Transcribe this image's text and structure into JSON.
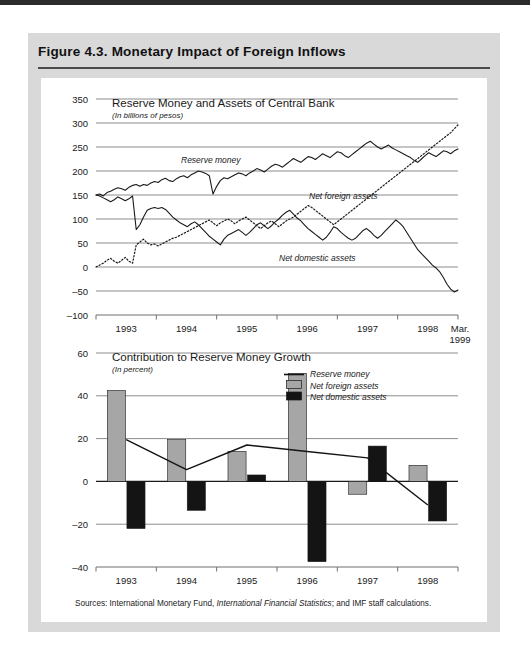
{
  "figure": {
    "title": "Figure 4.3.  Monetary Impact of Foreign Inflows",
    "sources_prefix": "Sources:  International Monetary Fund, ",
    "sources_italic": "International Financial Statistics",
    "sources_suffix": "; and IMF staff calculations."
  },
  "colors": {
    "page_background": "#ffffff",
    "panel_background": "#d9d9d9",
    "plot_background": "#ffffff",
    "top_band": "#2b2b2b",
    "rule": "#4a4a4a",
    "grid": "#8d8d8d",
    "axis": "#6f6f6f",
    "ink": "#1a1a1a",
    "series_gray": "#a6a6a6",
    "series_black": "#141414"
  },
  "chart_data": [
    {
      "type": "line",
      "id": "reserve-money-and-assets",
      "title": "Reserve Money and Assets of Central Bank",
      "subtitle": "(In billions of pesos)",
      "xlabel": "",
      "ylabel": "",
      "ylim": [
        -100,
        350
      ],
      "yticks": [
        -100,
        -50,
        0,
        50,
        100,
        150,
        200,
        250,
        300,
        350
      ],
      "xticklabels": [
        "1993",
        "1994",
        "1995",
        "1996",
        "1997",
        "1998",
        "Mar.",
        "1999"
      ],
      "xlim_years": [
        1992.75,
        1999.25
      ],
      "grid": true,
      "annotations": [
        "Reserve money",
        "Net foreign assets",
        "Net domestic assets"
      ],
      "series": [
        {
          "name": "Reserve money",
          "style": "solid",
          "values": [
            150,
            152,
            148,
            155,
            158,
            162,
            165,
            163,
            160,
            166,
            170,
            172,
            168,
            172,
            170,
            175,
            178,
            176,
            182,
            185,
            180,
            178,
            184,
            188,
            190,
            186,
            192,
            196,
            200,
            198,
            195,
            190,
            152,
            168,
            180,
            186,
            184,
            188,
            192,
            196,
            194,
            190,
            196,
            200,
            205,
            202,
            198,
            204,
            210,
            214,
            212,
            208,
            214,
            220,
            226,
            222,
            218,
            224,
            230,
            228,
            224,
            230,
            236,
            232,
            228,
            234,
            240,
            238,
            232,
            228,
            234,
            240,
            246,
            252,
            258,
            262,
            256,
            250,
            246,
            250,
            254,
            248,
            244,
            240,
            236,
            232,
            228,
            222,
            218,
            225,
            232,
            238,
            234,
            230,
            236,
            242,
            240,
            236,
            242,
            246
          ]
        },
        {
          "name": "Net foreign assets",
          "style": "dotted",
          "values": [
            0,
            4,
            8,
            14,
            18,
            12,
            8,
            14,
            20,
            12,
            8,
            46,
            52,
            58,
            50,
            46,
            48,
            44,
            48,
            52,
            56,
            60,
            62,
            66,
            70,
            74,
            78,
            82,
            86,
            90,
            94,
            98,
            92,
            86,
            92,
            96,
            100,
            96,
            90,
            96,
            100,
            104,
            98,
            92,
            86,
            80,
            86,
            92,
            96,
            90,
            84,
            90,
            96,
            100,
            104,
            110,
            116,
            122,
            128,
            124,
            118,
            112,
            106,
            100,
            94,
            88,
            94,
            100,
            106,
            112,
            118,
            124,
            130,
            136,
            142,
            148,
            154,
            160,
            166,
            172,
            178,
            184,
            190,
            196,
            202,
            208,
            214,
            220,
            226,
            232,
            238,
            244,
            250,
            256,
            262,
            268,
            274,
            280,
            288,
            296
          ]
        },
        {
          "name": "Net domestic assets",
          "style": "solid",
          "values": [
            150,
            148,
            144,
            140,
            136,
            140,
            146,
            142,
            138,
            142,
            148,
            78,
            88,
            104,
            118,
            122,
            124,
            122,
            124,
            120,
            112,
            104,
            98,
            92,
            88,
            84,
            90,
            94,
            88,
            80,
            72,
            64,
            58,
            52,
            46,
            58,
            66,
            70,
            74,
            78,
            72,
            66,
            72,
            80,
            88,
            92,
            86,
            80,
            86,
            94,
            100,
            108,
            114,
            118,
            110,
            102,
            96,
            88,
            80,
            74,
            68,
            62,
            56,
            62,
            72,
            84,
            80,
            72,
            66,
            60,
            56,
            60,
            68,
            76,
            80,
            74,
            66,
            60,
            66,
            74,
            82,
            90,
            98,
            92,
            84,
            72,
            60,
            48,
            36,
            28,
            20,
            12,
            4,
            -2,
            -10,
            -22,
            -36,
            -46,
            -52,
            -48
          ]
        }
      ]
    },
    {
      "type": "bar",
      "id": "contribution-to-reserve-money-growth",
      "title": "Contribution to Reserve Money Growth",
      "subtitle": "(In percent)",
      "xlabel": "",
      "ylabel": "",
      "ylim": [
        -40,
        60
      ],
      "yticks": [
        -40,
        -20,
        0,
        20,
        40,
        60
      ],
      "categories": [
        "1993",
        "1994",
        "1995",
        "1996",
        "1997",
        "1998"
      ],
      "grid": true,
      "legend_position": "top-right",
      "legend": [
        {
          "label": "Reserve money",
          "kind": "line",
          "color": "#141414"
        },
        {
          "label": "Net foreign assets",
          "kind": "swatch",
          "color": "#a6a6a6"
        },
        {
          "label": "Net domestic assets",
          "kind": "swatch",
          "color": "#141414"
        }
      ],
      "series": [
        {
          "name": "Net foreign assets",
          "kind": "bar",
          "color": "#a6a6a6",
          "values": [
            42.5,
            19.5,
            14.0,
            50.5,
            -6.0,
            7.5
          ]
        },
        {
          "name": "Net domestic assets",
          "kind": "bar",
          "color": "#141414",
          "values": [
            -22.0,
            -13.5,
            3.0,
            -37.5,
            16.5,
            -18.5
          ]
        },
        {
          "name": "Reserve money",
          "kind": "line",
          "color": "#141414",
          "values": [
            19.5,
            5.5,
            17.0,
            14.0,
            11.0,
            -11.0
          ]
        }
      ]
    }
  ]
}
